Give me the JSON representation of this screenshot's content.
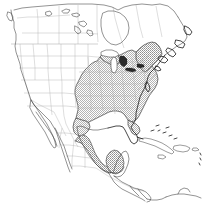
{
  "map": {
    "title": "North America species distribution range map",
    "type": "species-range-map",
    "projection": "lambert-conformal-conic",
    "background_color": "#ffffff",
    "width": 203,
    "height": 205,
    "legend_visible": false,
    "labels_visible": false,
    "graticule_visible": false,
    "colors": {
      "ocean": "#ffffff",
      "land": "#ffffff",
      "coastline": "#3a3a3a",
      "coastline_dark": "#1a1a1a",
      "admin_border": "#b0b0b0",
      "range_shading": "#b4b4b4",
      "lake_fill": "#ffffff",
      "lake_outline": "#2e2e2e"
    },
    "range": {
      "pattern": "checkerboard-dither",
      "pattern_color": "#b4b4b4",
      "outline_color": "#2b2b2b",
      "description": "Shaded distribution covering the eastern and southeastern United States, extending north to the Great Lakes and New England, west to eastern Texas and the eastern Great Plains, south along the Gulf coast of Mexico as a narrow coastal strip, and into the Yucatan, Belize and Guatemala.",
      "regions_included": [
        "Eastern United States",
        "Southeastern United States",
        "Great Lakes region",
        "New England",
        "Mid-Atlantic",
        "Eastern Texas",
        "Gulf Coast of Mexico",
        "Yucatan Peninsula",
        "Belize",
        "Guatemala"
      ],
      "regions_excluded": [
        "Western United States",
        "Pacific Northwest",
        "Rocky Mountains",
        "Great Basin",
        "Canada",
        "Baja California",
        "Caribbean islands",
        "Northern South America"
      ]
    },
    "features": {
      "countries": [
        "Canada",
        "United States",
        "Mexico",
        "Guatemala",
        "Belize",
        "Honduras",
        "El Salvador",
        "Nicaragua",
        "Costa Rica",
        "Panama",
        "Cuba",
        "Jamaica",
        "Haiti",
        "Dominican Republic"
      ],
      "water_bodies": [
        "Great Lakes",
        "Gulf of Mexico",
        "Caribbean Sea",
        "Hudson Bay",
        "Atlantic Ocean",
        "Pacific Ocean"
      ],
      "islands": [
        "Vancouver Island",
        "Newfoundland",
        "Cuba",
        "Hispaniola",
        "Jamaica",
        "Puerto Rico",
        "Lesser Antilles",
        "Florida Keys",
        "Bahamas"
      ]
    }
  }
}
